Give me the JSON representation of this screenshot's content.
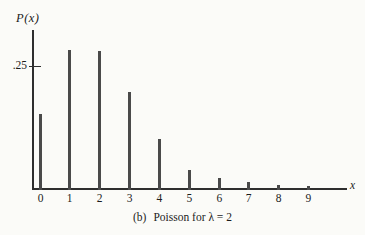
{
  "figure": {
    "y_axis_label": "P(x)",
    "y_tick_label": ".25",
    "x_axis_label": "x",
    "caption_index": "(b)",
    "caption_text": "Poisson for λ = 2"
  },
  "chart_data": {
    "type": "bar",
    "subtype": "stick-plot",
    "xlabel": "x",
    "ylabel": "P(x)",
    "categories": [
      0,
      1,
      2,
      3,
      4,
      5,
      6,
      7,
      8,
      9
    ],
    "values": [
      0.135,
      0.271,
      0.271,
      0.18,
      0.09,
      0.036,
      0.012,
      0.003,
      0.001,
      0.0002
    ],
    "x_tick_labels": [
      "0",
      "1",
      "2",
      "3",
      "4",
      "5",
      "6",
      "7",
      "8",
      "9"
    ],
    "y_ticks": [
      {
        "value": 0.25,
        "label": ".25"
      }
    ],
    "ylim": [
      0,
      0.31
    ],
    "grid": false,
    "legend": null,
    "colors": {
      "bar": "#4a4a4a",
      "axis": "#2e2e2e",
      "text": "#1c1c1c",
      "background": "#fbfbf8"
    },
    "layout": {
      "bar_x_px": [
        40.5,
        69.7,
        99.7,
        129.5,
        159.3,
        189.3,
        219.3,
        248.7,
        278.5,
        308.4
      ],
      "bar_heights_px": [
        76,
        140,
        139,
        98,
        51,
        20,
        12,
        8,
        5,
        4
      ],
      "baseline_y_px": 189.5,
      "axis_left_px": 32,
      "axis_top_px": 30,
      "axis_right_px": 347,
      "y_tick_y_px": 66
    }
  }
}
